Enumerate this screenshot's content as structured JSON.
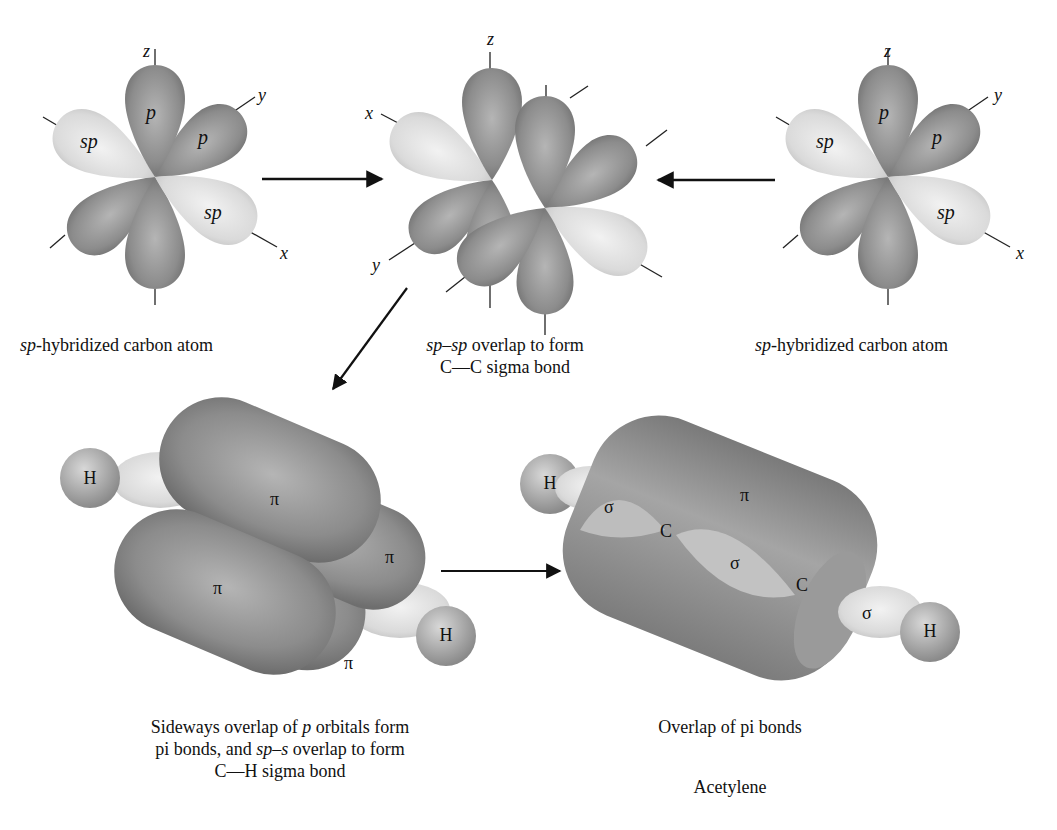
{
  "panels": {
    "left_carbon": {
      "caption_italic": "sp",
      "caption_rest": "-hybridized carbon atom",
      "axes": {
        "z": "z",
        "y": "y",
        "x": "x"
      },
      "orbital_labels": {
        "sp_a": "sp",
        "sp_b": "sp",
        "p_a": "p",
        "p_b": "p"
      }
    },
    "center_overlap": {
      "caption_line1_italic": "sp–sp",
      "caption_line1_rest": " overlap to form",
      "caption_line2": "C—C sigma bond",
      "axes": {
        "z": "z",
        "x": "x",
        "y": "y"
      }
    },
    "right_carbon": {
      "caption_italic": "sp",
      "caption_rest": "-hybridized carbon atom",
      "axes": {
        "z": "z",
        "y": "y",
        "x": "x"
      },
      "orbital_labels": {
        "sp_a": "sp",
        "sp_b": "sp",
        "p_a": "p",
        "p_b": "p"
      }
    },
    "pi_bonds": {
      "caption_line1_pre": "Sideways overlap of ",
      "caption_line1_italic": "p",
      "caption_line1_post": " orbitals form",
      "caption_line2_pre": "pi bonds, and ",
      "caption_line2_italic": "sp–s",
      "caption_line2_post": " overlap to form",
      "caption_line3": "C—H sigma bond",
      "labels": {
        "h_left": "H",
        "h_right": "H",
        "pi_top": "π",
        "pi_right": "π",
        "pi_front": "π",
        "pi_bottom": "π"
      }
    },
    "acetylene": {
      "caption_line1": "Overlap of pi bonds",
      "caption_line2": "Acetylene",
      "labels": {
        "h_left": "H",
        "h_right": "H",
        "sigma_left": "σ",
        "sigma_center": "σ",
        "sigma_right": "σ",
        "pi": "π",
        "c_left": "C",
        "c_right": "C"
      }
    }
  },
  "colors": {
    "dark_lobe": "#8a8a8a",
    "light_lobe": "#d9d9d9",
    "text": "#111111"
  }
}
